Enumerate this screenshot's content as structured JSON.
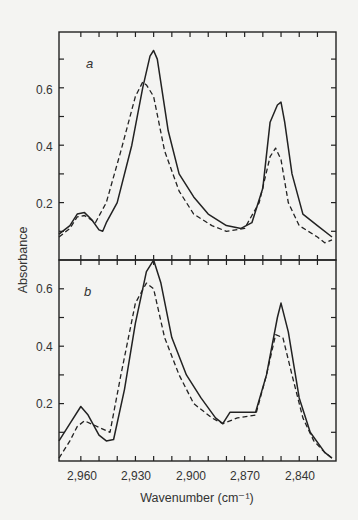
{
  "chart_data": [
    {
      "type": "line",
      "panel": "a",
      "panel_label": "a",
      "xlabel": "Wavenumber (cm⁻¹)",
      "ylabel": "Absorbance",
      "xlim": [
        2972,
        2822
      ],
      "ylim": [
        0,
        0.8
      ],
      "x_reversed": true,
      "yticks": [
        0.1,
        0.2,
        0.3,
        0.4,
        0.5,
        0.6,
        0.7
      ],
      "ytick_labels": {
        "0.2": "0.2",
        "0.4": "0.4",
        "0.6": "0.6"
      },
      "grid": false,
      "series": [
        {
          "name": "solid",
          "style": "solid",
          "x": [
            2972,
            2966,
            2962,
            2958,
            2954,
            2950,
            2948,
            2946,
            2940,
            2932,
            2926,
            2922,
            2920,
            2918,
            2912,
            2906,
            2898,
            2890,
            2880,
            2872,
            2866,
            2860,
            2856,
            2852,
            2850,
            2848,
            2844,
            2838,
            2830,
            2822
          ],
          "y": [
            0.09,
            0.12,
            0.16,
            0.165,
            0.14,
            0.105,
            0.1,
            0.13,
            0.2,
            0.4,
            0.6,
            0.71,
            0.73,
            0.7,
            0.45,
            0.3,
            0.22,
            0.16,
            0.12,
            0.11,
            0.13,
            0.25,
            0.48,
            0.54,
            0.55,
            0.48,
            0.3,
            0.16,
            0.12,
            0.08
          ]
        },
        {
          "name": "dashed",
          "style": "dashed",
          "x": [
            2972,
            2966,
            2962,
            2958,
            2952,
            2946,
            2938,
            2930,
            2926,
            2924,
            2920,
            2914,
            2906,
            2898,
            2888,
            2880,
            2870,
            2862,
            2856,
            2853,
            2850,
            2846,
            2840,
            2830,
            2826,
            2822
          ],
          "y": [
            0.08,
            0.11,
            0.15,
            0.155,
            0.13,
            0.2,
            0.38,
            0.57,
            0.62,
            0.61,
            0.57,
            0.38,
            0.24,
            0.16,
            0.12,
            0.1,
            0.11,
            0.2,
            0.36,
            0.39,
            0.35,
            0.2,
            0.12,
            0.08,
            0.06,
            0.07
          ]
        }
      ]
    },
    {
      "type": "line",
      "panel": "b",
      "panel_label": "b",
      "xlabel": "Wavenumber (cm⁻¹)",
      "ylabel": "Absorbance",
      "xlim": [
        2972,
        2822
      ],
      "ylim": [
        0,
        0.7
      ],
      "x_reversed": true,
      "xticks": [
        2960,
        2930,
        2900,
        2870,
        2840
      ],
      "xtick_labels": [
        "2,960",
        "2,930",
        "2,900",
        "2,870",
        "2,840"
      ],
      "yticks": [
        0.1,
        0.2,
        0.3,
        0.4,
        0.5,
        0.6
      ],
      "ytick_labels": {
        "0.2": "0.2",
        "0.4": "0.4",
        "0.6": "0.6"
      },
      "grid": false,
      "series": [
        {
          "name": "solid",
          "style": "solid",
          "x": [
            2972,
            2966,
            2960,
            2956,
            2950,
            2946,
            2942,
            2936,
            2930,
            2924,
            2920,
            2916,
            2910,
            2902,
            2894,
            2886,
            2882,
            2878,
            2870,
            2864,
            2858,
            2852,
            2850,
            2846,
            2840,
            2834,
            2826,
            2822
          ],
          "y": [
            0.07,
            0.13,
            0.19,
            0.16,
            0.09,
            0.07,
            0.075,
            0.25,
            0.48,
            0.66,
            0.7,
            0.62,
            0.43,
            0.3,
            0.22,
            0.15,
            0.13,
            0.17,
            0.17,
            0.17,
            0.3,
            0.5,
            0.55,
            0.45,
            0.22,
            0.1,
            0.03,
            0.01
          ]
        },
        {
          "name": "dashed",
          "style": "dashed",
          "x": [
            2972,
            2966,
            2962,
            2958,
            2944,
            2938,
            2930,
            2924,
            2920,
            2914,
            2906,
            2898,
            2888,
            2882,
            2874,
            2864,
            2858,
            2853,
            2849,
            2844,
            2838,
            2832,
            2826,
            2822
          ],
          "y": [
            0.01,
            0.07,
            0.12,
            0.14,
            0.1,
            0.3,
            0.55,
            0.62,
            0.6,
            0.43,
            0.3,
            0.2,
            0.15,
            0.13,
            0.15,
            0.16,
            0.3,
            0.44,
            0.43,
            0.3,
            0.15,
            0.07,
            0.03,
            0.01
          ]
        }
      ]
    }
  ],
  "labels": {
    "panel_a": "a",
    "panel_b": "b",
    "y_axis_title": "Absorbance",
    "x_axis_title": "Wavenumber (cm⁻¹)",
    "y_ticks": [
      "0.2",
      "0.4",
      "0.6"
    ],
    "x_ticks": [
      "2,960",
      "2,930",
      "2,900",
      "2,870",
      "2,840"
    ]
  }
}
